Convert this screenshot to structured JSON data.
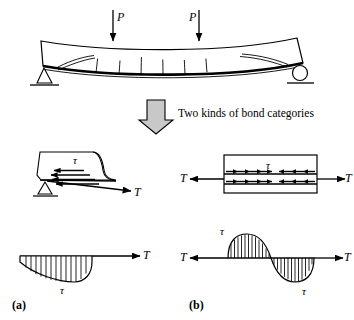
{
  "figure": {
    "title_text": "Two kinds of bond categories",
    "panels": [
      {
        "key": "a",
        "label": "(a)"
      },
      {
        "key": "b",
        "label": "(b)"
      }
    ]
  },
  "beam": {
    "load_left_label": "P",
    "load_right_label": "P",
    "support_left": "pin-support",
    "support_right": "roller-support",
    "crack_count": 6,
    "description": "simply supported beam with two point loads, bonded soffit plate and flexural cracks"
  },
  "flow_arrow": {
    "direction": "down",
    "fill_color": "#c8c8c8",
    "stroke_color": "#000000"
  },
  "panel_a": {
    "detail": {
      "tau_label": "τ",
      "force_label": "T",
      "shear_arrow_count": 4,
      "support": "pin-support"
    },
    "distribution": {
      "tau_label": "τ",
      "force_label": "T",
      "shape": "single-sided-decaying-lobe-below-axis",
      "hatch_line_count": 12
    },
    "caption": "(a)"
  },
  "panel_b": {
    "detail": {
      "tau_label": "τ",
      "force_label_left": "T",
      "force_label_right": "T",
      "arrow_rows": 2,
      "arrows_per_row": 8
    },
    "distribution": {
      "tau_label_top": "τ",
      "tau_label_bottom": "τ",
      "force_label_left": "T",
      "force_label_right": "T",
      "shape": "antisymmetric-sine-lobes",
      "hatch_line_count": 22
    },
    "caption": "(b)"
  },
  "colors": {
    "ink": "#000000",
    "background": "#ffffff",
    "arrow_fill": "#c8c8c8"
  }
}
